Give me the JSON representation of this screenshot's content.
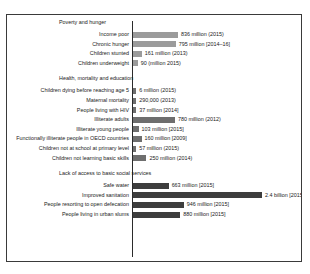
{
  "chart_data": {
    "type": "bar",
    "orientation": "horizontal",
    "title": "",
    "xlabel": "",
    "ylabel": "",
    "grid": false,
    "legend": "none",
    "bar_color": "#8c8c8c",
    "axis_color": "#2b2b2b",
    "xlim": [
      0,
      2400
    ],
    "unit_note": "values in millions",
    "groups": [
      {
        "name": "Poverty and hunger",
        "items": [
          {
            "label": "Income poor",
            "value": 836,
            "value_label": "836 million (2015)",
            "color": "#9b9b9b"
          },
          {
            "label": "Chronic hunger",
            "value": 795,
            "value_label": "795 million [2014–16]",
            "color": "#9b9b9b"
          },
          {
            "label": "Children stunted",
            "value": 161,
            "value_label": "161 million (2013)",
            "color": "#9b9b9b"
          },
          {
            "label": "Children underweight",
            "value": 90,
            "value_label": "90 (million 2015)",
            "color": "#9b9b9b"
          }
        ]
      },
      {
        "name": "Health, mortality and education",
        "items": [
          {
            "label": "Children dying before reaching age 5",
            "value": 6,
            "value_label": "6 million (2015)",
            "color": "#6e6e6e"
          },
          {
            "label": "Maternal mortality",
            "value": 0.29,
            "value_label": "290,000 (2013)",
            "color": "#6e6e6e"
          },
          {
            "label": "People living with HIV",
            "value": 37,
            "value_label": "37 million [2014]",
            "color": "#6e6e6e"
          },
          {
            "label": "Illiterate adults",
            "value": 780,
            "value_label": "780 million (2012)",
            "color": "#6e6e6e"
          },
          {
            "label": "Illiterate young people",
            "value": 103,
            "value_label": "103 million [2015]",
            "color": "#6e6e6e"
          },
          {
            "label": "Functionally illiterate people in OECD countries",
            "value": 160,
            "value_label": "160 million [2009]",
            "color": "#6e6e6e"
          },
          {
            "label": "Children not at school at primary level",
            "value": 57,
            "value_label": "57 million (2015)",
            "color": "#6e6e6e"
          },
          {
            "label": "Children not learning basic skills",
            "value": 250,
            "value_label": "250 million (2014)",
            "color": "#6e6e6e"
          }
        ]
      },
      {
        "name": "Lack of access to basic social services",
        "items": [
          {
            "label": "Safe water",
            "value": 663,
            "value_label": "663 million [2015]",
            "color": "#3d3d3d"
          },
          {
            "label": "Improved sanitation",
            "value": 2400,
            "value_label": "2.4 billion [2015]",
            "color": "#3d3d3d"
          },
          {
            "label": "People resorting to open defecation",
            "value": 946,
            "value_label": "946 million [2015]",
            "color": "#3d3d3d"
          },
          {
            "label": "People living in urban slums",
            "value": 880,
            "value_label": "880 million [2015]",
            "color": "#3d3d3d"
          }
        ]
      }
    ]
  }
}
